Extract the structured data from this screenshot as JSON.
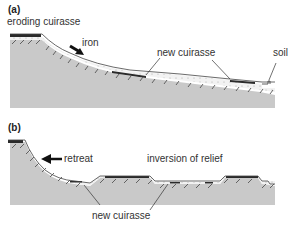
{
  "panels": [
    {
      "id": "a",
      "tag": "(a)",
      "labels": {
        "eroding": "eroding cuirasse",
        "iron": "iron",
        "new_cuirasse": "new cuirasse",
        "soil": "soil"
      }
    },
    {
      "id": "b",
      "tag": "(b)",
      "labels": {
        "retreat": "retreat",
        "inversion": "inversion of relief",
        "new_cuirasse": "new cuirasse"
      }
    }
  ],
  "colors": {
    "bedrock": "#c8c8c8",
    "cuirasse": "#2a2a2a",
    "hatch": "#555555",
    "text": "#333333"
  }
}
